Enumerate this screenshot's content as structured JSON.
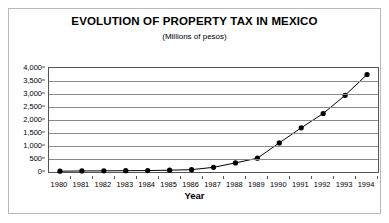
{
  "chart_data": {
    "type": "line",
    "title": "EVOLUTION OF PROPERTY TAX IN MEXICO",
    "subtitle": "(Millions of pesos)",
    "xlabel": "Year",
    "ylabel": "",
    "categories": [
      "1980",
      "1981",
      "1982",
      "1983",
      "1984",
      "1985",
      "1986",
      "1987",
      "1988",
      "1989",
      "1990",
      "1991",
      "1992",
      "1993",
      "1994"
    ],
    "values": [
      30,
      40,
      45,
      50,
      55,
      70,
      90,
      180,
      350,
      530,
      1120,
      1700,
      2250,
      2950,
      3750
    ],
    "series": [
      {
        "name": "Property tax",
        "values": [
          30,
          40,
          45,
          50,
          55,
          70,
          90,
          180,
          350,
          530,
          1120,
          1700,
          2250,
          2950,
          3750
        ]
      }
    ],
    "ylim": [
      0,
      4000
    ],
    "y_ticks": [
      0,
      500,
      1000,
      1500,
      2000,
      2500,
      3000,
      3500,
      4000
    ],
    "y_tick_labels": [
      "0",
      "500",
      "1,000",
      "1,500",
      "2,000",
      "2,500",
      "3,000",
      "3,500",
      "4,000"
    ],
    "grid": true,
    "grid_axis": "y",
    "legend": false,
    "legend_position": "none",
    "marker": "filled-circle",
    "line_color": "#000000",
    "marker_color": "#000000",
    "grid_color": "#8a8a8a",
    "plot_background": "#ffffff",
    "border_color": "#555555"
  }
}
